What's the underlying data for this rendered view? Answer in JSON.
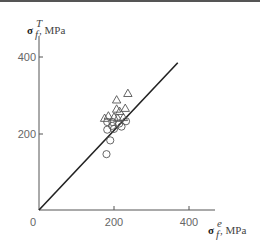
{
  "chart_data": {
    "type": "scatter",
    "title": "",
    "xlabel": "σ_f^e, MPa",
    "ylabel": "σ_f^T, MPa",
    "xlim": [
      0,
      460
    ],
    "ylim": [
      0,
      460
    ],
    "x_ticks": [
      0,
      200,
      400
    ],
    "y_ticks": [
      200,
      400
    ],
    "grid": false,
    "legend": null,
    "reference_line": {
      "type": "y=x",
      "from": [
        0,
        0
      ],
      "to": [
        370,
        385
      ]
    },
    "series": [
      {
        "name": "triangles",
        "marker": "triangle-open",
        "points": [
          [
            237,
            305
          ],
          [
            207,
            288
          ],
          [
            230,
            266
          ],
          [
            207,
            264
          ],
          [
            215,
            258
          ],
          [
            185,
            246
          ],
          [
            200,
            243
          ],
          [
            210,
            240
          ],
          [
            175,
            240
          ],
          [
            225,
            242
          ]
        ]
      },
      {
        "name": "circles",
        "marker": "circle-open",
        "points": [
          [
            182,
            230
          ],
          [
            196,
            230
          ],
          [
            214,
            226
          ],
          [
            232,
            232
          ],
          [
            195,
            220
          ],
          [
            220,
            218
          ],
          [
            182,
            210
          ],
          [
            200,
            212
          ],
          [
            190,
            182
          ],
          [
            180,
            146
          ]
        ]
      }
    ]
  },
  "labels": {
    "y_axis": {
      "symbol": "σ",
      "sup": "T",
      "sub": "f",
      "unit": ", MPa"
    },
    "x_axis": {
      "symbol": "σ",
      "sup": "e",
      "sub": "f",
      "unit": ", MPa"
    },
    "origin": "0",
    "x_tick_200": "200",
    "x_tick_400": "400",
    "y_tick_200": "200",
    "y_tick_400": "400"
  },
  "colors": {
    "axis": "#555555",
    "line": "#222222",
    "marker": "#555555"
  }
}
